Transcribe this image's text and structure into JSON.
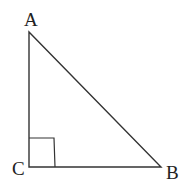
{
  "diagram": {
    "type": "right-triangle",
    "vertices": [
      {
        "label": "A",
        "x": 29,
        "y": 32
      },
      {
        "label": "C",
        "x": 29,
        "y": 167
      },
      {
        "label": "B",
        "x": 161,
        "y": 167
      }
    ],
    "right_angle_at": "C",
    "labels": {
      "a": "A",
      "b": "B",
      "c": "C"
    },
    "stroke_color": "#333333"
  }
}
